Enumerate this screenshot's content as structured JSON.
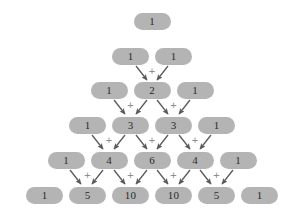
{
  "figure": {
    "background_color": "#ffffff",
    "cell_color": "#b4b4b4",
    "text_color": "#2b2b2b",
    "arrow_color": "#5a5a5a",
    "plus_color": "#8d8d8d",
    "plus_symbol": "+"
  },
  "chart_data": {
    "type": "diagram",
    "rows": [
      {
        "index": 0,
        "values": [
          "1"
        ]
      },
      {
        "index": 1,
        "values": [
          "1",
          "1"
        ]
      },
      {
        "index": 2,
        "values": [
          "1",
          "2",
          "1"
        ]
      },
      {
        "index": 3,
        "values": [
          "1",
          "3",
          "3",
          "1"
        ]
      },
      {
        "index": 4,
        "values": [
          "1",
          "4",
          "6",
          "4",
          "1"
        ]
      },
      {
        "index": 5,
        "values": [
          "1",
          "5",
          "10",
          "10",
          "5",
          "1"
        ]
      }
    ]
  },
  "cells": [
    {
      "id": "r0c0",
      "value": "1",
      "row": 0,
      "col": 0,
      "x": 152,
      "y": 21
    },
    {
      "id": "r1c0",
      "value": "1",
      "row": 1,
      "col": 0,
      "x": 130.5,
      "y": 56
    },
    {
      "id": "r1c1",
      "value": "1",
      "row": 1,
      "col": 1,
      "x": 173.5,
      "y": 56
    },
    {
      "id": "r2c0",
      "value": "1",
      "row": 2,
      "col": 0,
      "x": 109,
      "y": 90
    },
    {
      "id": "r2c1",
      "value": "2",
      "row": 2,
      "col": 1,
      "x": 152,
      "y": 90
    },
    {
      "id": "r2c2",
      "value": "1",
      "row": 2,
      "col": 2,
      "x": 195,
      "y": 90
    },
    {
      "id": "r3c0",
      "value": "1",
      "row": 3,
      "col": 0,
      "x": 87.5,
      "y": 125
    },
    {
      "id": "r3c1",
      "value": "3",
      "row": 3,
      "col": 1,
      "x": 130.5,
      "y": 125
    },
    {
      "id": "r3c2",
      "value": "3",
      "row": 3,
      "col": 2,
      "x": 173.5,
      "y": 125
    },
    {
      "id": "r3c3",
      "value": "1",
      "row": 3,
      "col": 3,
      "x": 216.5,
      "y": 125
    },
    {
      "id": "r4c0",
      "value": "1",
      "row": 4,
      "col": 0,
      "x": 66,
      "y": 160
    },
    {
      "id": "r4c1",
      "value": "4",
      "row": 4,
      "col": 1,
      "x": 109,
      "y": 160
    },
    {
      "id": "r4c2",
      "value": "6",
      "row": 4,
      "col": 2,
      "x": 152,
      "y": 160
    },
    {
      "id": "r4c3",
      "value": "4",
      "row": 4,
      "col": 3,
      "x": 195,
      "y": 160
    },
    {
      "id": "r4c4",
      "value": "1",
      "row": 4,
      "col": 4,
      "x": 238,
      "y": 160
    },
    {
      "id": "r5c0",
      "value": "1",
      "row": 5,
      "col": 0,
      "x": 44.5,
      "y": 195
    },
    {
      "id": "r5c1",
      "value": "5",
      "row": 5,
      "col": 1,
      "x": 87.5,
      "y": 195
    },
    {
      "id": "r5c2",
      "value": "10",
      "row": 5,
      "col": 2,
      "x": 130.5,
      "y": 195
    },
    {
      "id": "r5c3",
      "value": "10",
      "row": 5,
      "col": 3,
      "x": 173.5,
      "y": 195
    },
    {
      "id": "r5c4",
      "value": "5",
      "row": 5,
      "col": 4,
      "x": 216.5,
      "y": 195
    },
    {
      "id": "r5c5",
      "value": "1",
      "row": 5,
      "col": 5,
      "x": 259.5,
      "y": 195
    }
  ],
  "arrows": [
    {
      "id": "a-r1c0-r2c1",
      "from": "r1c0",
      "to": "r2c1",
      "x1": 136,
      "y1": 66,
      "x2": 147,
      "y2": 80
    },
    {
      "id": "a-r1c1-r2c1",
      "from": "r1c1",
      "to": "r2c1",
      "x1": 168,
      "y1": 66,
      "x2": 157,
      "y2": 80
    },
    {
      "id": "a-r2c0-r3c1",
      "from": "r2c0",
      "to": "r3c1",
      "x1": 114,
      "y1": 100,
      "x2": 125,
      "y2": 114
    },
    {
      "id": "a-r2c1-r3c1",
      "from": "r2c1",
      "to": "r3c1",
      "x1": 147,
      "y1": 100,
      "x2": 136,
      "y2": 114
    },
    {
      "id": "a-r2c1-r3c2",
      "from": "r2c1",
      "to": "r3c2",
      "x1": 157,
      "y1": 100,
      "x2": 168,
      "y2": 114
    },
    {
      "id": "a-r2c2-r3c2",
      "from": "r2c2",
      "to": "r3c2",
      "x1": 190,
      "y1": 100,
      "x2": 179,
      "y2": 114
    },
    {
      "id": "a-r3c0-r4c1",
      "from": "r3c0",
      "to": "r4c1",
      "x1": 92,
      "y1": 135,
      "x2": 103,
      "y2": 149
    },
    {
      "id": "a-r3c1-r4c1",
      "from": "r3c1",
      "to": "r4c1",
      "x1": 125,
      "y1": 135,
      "x2": 114,
      "y2": 149
    },
    {
      "id": "a-r3c1-r4c2",
      "from": "r3c1",
      "to": "r4c2",
      "x1": 136,
      "y1": 135,
      "x2": 147,
      "y2": 149
    },
    {
      "id": "a-r3c2-r4c2",
      "from": "r3c2",
      "to": "r4c2",
      "x1": 168,
      "y1": 135,
      "x2": 157,
      "y2": 149
    },
    {
      "id": "a-r3c2-r4c3",
      "from": "r3c2",
      "to": "r4c3",
      "x1": 179,
      "y1": 135,
      "x2": 190,
      "y2": 149
    },
    {
      "id": "a-r3c3-r4c3",
      "from": "r3c3",
      "to": "r4c3",
      "x1": 211,
      "y1": 135,
      "x2": 200,
      "y2": 149
    },
    {
      "id": "a-r4c0-r5c1",
      "from": "r4c0",
      "to": "r5c1",
      "x1": 70,
      "y1": 170,
      "x2": 81,
      "y2": 184
    },
    {
      "id": "a-r4c1-r5c1",
      "from": "r4c1",
      "to": "r5c1",
      "x1": 103,
      "y1": 170,
      "x2": 92,
      "y2": 184
    },
    {
      "id": "a-r4c1-r5c2",
      "from": "r4c1",
      "to": "r5c2",
      "x1": 114,
      "y1": 170,
      "x2": 125,
      "y2": 184
    },
    {
      "id": "a-r4c2-r5c2",
      "from": "r4c2",
      "to": "r5c2",
      "x1": 147,
      "y1": 170,
      "x2": 136,
      "y2": 184
    },
    {
      "id": "a-r4c2-r5c3",
      "from": "r4c2",
      "to": "r5c3",
      "x1": 157,
      "y1": 170,
      "x2": 168,
      "y2": 184
    },
    {
      "id": "a-r4c3-r5c3",
      "from": "r4c3",
      "to": "r5c3",
      "x1": 190,
      "y1": 170,
      "x2": 179,
      "y2": 184
    },
    {
      "id": "a-r4c3-r5c4",
      "from": "r4c3",
      "to": "r5c4",
      "x1": 200,
      "y1": 170,
      "x2": 211,
      "y2": 184
    },
    {
      "id": "a-r4c4-r5c4",
      "from": "r4c4",
      "to": "r5c4",
      "x1": 233,
      "y1": 170,
      "x2": 222,
      "y2": 184
    }
  ],
  "plus_marks": [
    {
      "id": "p-r2c1",
      "symbol": "+",
      "x": 152,
      "y": 71
    },
    {
      "id": "p-r3c1",
      "symbol": "+",
      "x": 130.5,
      "y": 105
    },
    {
      "id": "p-r3c2",
      "symbol": "+",
      "x": 173.5,
      "y": 105
    },
    {
      "id": "p-r4c1",
      "symbol": "+",
      "x": 109,
      "y": 140
    },
    {
      "id": "p-r4c2",
      "symbol": "+",
      "x": 152,
      "y": 140
    },
    {
      "id": "p-r4c3",
      "symbol": "+",
      "x": 195,
      "y": 140
    },
    {
      "id": "p-r5c1",
      "symbol": "+",
      "x": 87.5,
      "y": 175
    },
    {
      "id": "p-r5c2",
      "symbol": "+",
      "x": 130.5,
      "y": 175
    },
    {
      "id": "p-r5c3",
      "symbol": "+",
      "x": 173.5,
      "y": 175
    },
    {
      "id": "p-r5c4",
      "symbol": "+",
      "x": 216.5,
      "y": 175
    }
  ]
}
